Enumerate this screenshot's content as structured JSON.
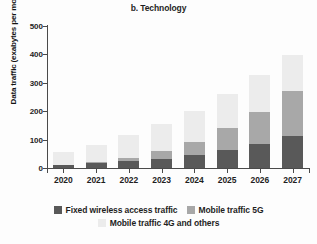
{
  "chart_data": {
    "type": "bar",
    "stacked": true,
    "title": "b. Technology",
    "xlabel": "",
    "ylabel": "Data traffic (exabytes per month)",
    "categories": [
      "2020",
      "2021",
      "2022",
      "2023",
      "2024",
      "2025",
      "2026",
      "2027"
    ],
    "ylim": [
      0,
      500
    ],
    "yticks": [
      0,
      100,
      200,
      300,
      400,
      500
    ],
    "ytick_labels": [
      "0",
      "100",
      "200",
      "300",
      "400",
      "500"
    ],
    "grid": false,
    "legend_position": "bottom",
    "series": [
      {
        "name": "Fixed wireless access traffic",
        "color": "#595959",
        "values": [
          10,
          18,
          25,
          31,
          45,
          64,
          85,
          111
        ]
      },
      {
        "name": "Mobile traffic 5G",
        "color": "#a8a8a8",
        "values": [
          0,
          3,
          12,
          30,
          48,
          76,
          114,
          160
        ]
      },
      {
        "name": "Mobile traffic 4G and others",
        "color": "#ececec",
        "values": [
          45,
          60,
          80,
          93,
          108,
          120,
          127,
          126
        ]
      }
    ],
    "totals": [
      55,
      81,
      117,
      154,
      201,
      260,
      326,
      397
    ]
  }
}
